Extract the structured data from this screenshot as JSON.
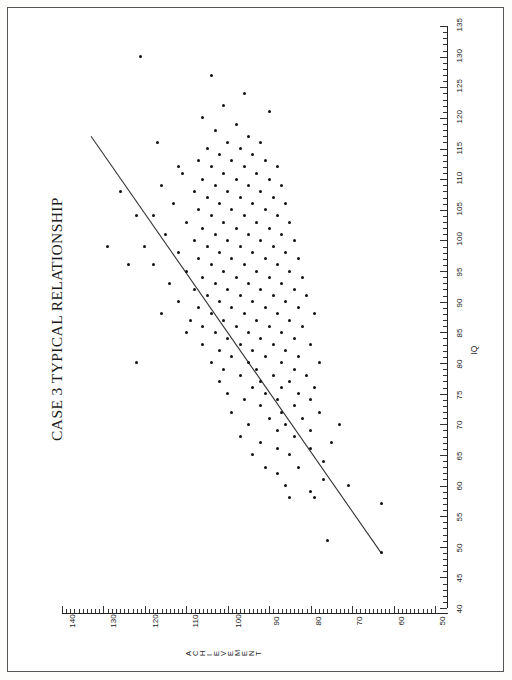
{
  "page": {
    "orientation": "rotated-90",
    "frame_color": "#555555",
    "background": "#ffffff"
  },
  "chart_data": {
    "type": "scatter",
    "title": "CASE 3 TYPICAL RELATIONSHIP",
    "xlabel": "IQ",
    "ylabel": "ACHIEVEMENT",
    "xlim": [
      40,
      135
    ],
    "ylim": [
      50,
      140
    ],
    "grid": false,
    "legend": null,
    "xticks": [
      40,
      45,
      50,
      55,
      60,
      65,
      70,
      75,
      80,
      85,
      90,
      95,
      100,
      105,
      110,
      115,
      120,
      125,
      130,
      135
    ],
    "yticks": [
      50,
      60,
      70,
      80,
      90,
      100,
      110,
      120,
      130,
      140
    ],
    "minor_tick_step": 1,
    "marker": "filled-circle",
    "marker_color": "#111111",
    "trendline": {
      "type": "linear-regression",
      "color": "#333333",
      "x_start": 49,
      "y_start": 63,
      "x_end": 117,
      "y_end": 133
    },
    "points": [
      [
        49,
        63
      ],
      [
        51,
        76
      ],
      [
        57,
        63
      ],
      [
        58,
        79
      ],
      [
        58,
        85
      ],
      [
        59,
        80
      ],
      [
        60,
        71
      ],
      [
        60,
        86
      ],
      [
        61,
        77
      ],
      [
        62,
        88
      ],
      [
        63,
        83
      ],
      [
        63,
        91
      ],
      [
        64,
        77
      ],
      [
        65,
        85
      ],
      [
        65,
        94
      ],
      [
        66,
        80
      ],
      [
        66,
        88
      ],
      [
        67,
        75
      ],
      [
        67,
        92
      ],
      [
        68,
        84
      ],
      [
        68,
        97
      ],
      [
        69,
        80
      ],
      [
        69,
        88
      ],
      [
        70,
        73
      ],
      [
        70,
        86
      ],
      [
        70,
        95
      ],
      [
        71,
        82
      ],
      [
        71,
        90
      ],
      [
        72,
        78
      ],
      [
        72,
        87
      ],
      [
        72,
        99
      ],
      [
        73,
        84
      ],
      [
        73,
        92
      ],
      [
        74,
        80
      ],
      [
        74,
        88
      ],
      [
        74,
        96
      ],
      [
        75,
        83
      ],
      [
        75,
        91
      ],
      [
        75,
        100
      ],
      [
        76,
        79
      ],
      [
        76,
        87
      ],
      [
        76,
        94
      ],
      [
        77,
        85
      ],
      [
        77,
        92
      ],
      [
        77,
        102
      ],
      [
        78,
        81
      ],
      [
        78,
        89
      ],
      [
        78,
        97
      ],
      [
        79,
        84
      ],
      [
        79,
        93
      ],
      [
        79,
        101
      ],
      [
        80,
        78
      ],
      [
        80,
        87
      ],
      [
        80,
        95
      ],
      [
        80,
        104
      ],
      [
        81,
        83
      ],
      [
        81,
        91
      ],
      [
        81,
        99
      ],
      [
        82,
        86
      ],
      [
        82,
        94
      ],
      [
        82,
        102
      ],
      [
        83,
        80
      ],
      [
        83,
        89
      ],
      [
        83,
        97
      ],
      [
        83,
        106
      ],
      [
        84,
        84
      ],
      [
        84,
        92
      ],
      [
        84,
        100
      ],
      [
        85,
        87
      ],
      [
        85,
        95
      ],
      [
        85,
        103
      ],
      [
        85,
        110
      ],
      [
        86,
        82
      ],
      [
        86,
        90
      ],
      [
        86,
        98
      ],
      [
        86,
        106
      ],
      [
        87,
        85
      ],
      [
        87,
        93
      ],
      [
        87,
        101
      ],
      [
        87,
        109
      ],
      [
        88,
        79
      ],
      [
        88,
        88
      ],
      [
        88,
        96
      ],
      [
        88,
        104
      ],
      [
        89,
        83
      ],
      [
        89,
        91
      ],
      [
        89,
        99
      ],
      [
        89,
        107
      ],
      [
        90,
        86
      ],
      [
        90,
        94
      ],
      [
        90,
        102
      ],
      [
        90,
        112
      ],
      [
        91,
        81
      ],
      [
        91,
        89
      ],
      [
        91,
        97
      ],
      [
        91,
        105
      ],
      [
        92,
        84
      ],
      [
        92,
        92
      ],
      [
        92,
        100
      ],
      [
        92,
        108
      ],
      [
        93,
        87
      ],
      [
        93,
        95
      ],
      [
        93,
        103
      ],
      [
        93,
        114
      ],
      [
        94,
        82
      ],
      [
        94,
        90
      ],
      [
        94,
        98
      ],
      [
        94,
        106
      ],
      [
        95,
        85
      ],
      [
        95,
        93
      ],
      [
        95,
        101
      ],
      [
        95,
        110
      ],
      [
        96,
        88
      ],
      [
        96,
        96
      ],
      [
        96,
        104
      ],
      [
        96,
        118
      ],
      [
        97,
        83
      ],
      [
        97,
        91
      ],
      [
        97,
        99
      ],
      [
        97,
        107
      ],
      [
        98,
        86
      ],
      [
        98,
        94
      ],
      [
        98,
        102
      ],
      [
        98,
        112
      ],
      [
        99,
        89
      ],
      [
        99,
        97
      ],
      [
        99,
        105
      ],
      [
        99,
        120
      ],
      [
        100,
        84
      ],
      [
        100,
        92
      ],
      [
        100,
        100
      ],
      [
        100,
        108
      ],
      [
        101,
        87
      ],
      [
        101,
        95
      ],
      [
        101,
        103
      ],
      [
        101,
        115
      ],
      [
        102,
        90
      ],
      [
        102,
        98
      ],
      [
        102,
        106
      ],
      [
        103,
        85
      ],
      [
        103,
        93
      ],
      [
        103,
        101
      ],
      [
        103,
        110
      ],
      [
        104,
        88
      ],
      [
        104,
        96
      ],
      [
        104,
        104
      ],
      [
        104,
        122
      ],
      [
        105,
        91
      ],
      [
        105,
        99
      ],
      [
        105,
        107
      ],
      [
        106,
        86
      ],
      [
        106,
        94
      ],
      [
        106,
        102
      ],
      [
        106,
        113
      ],
      [
        107,
        89
      ],
      [
        107,
        97
      ],
      [
        107,
        105
      ],
      [
        108,
        92
      ],
      [
        108,
        100
      ],
      [
        108,
        108
      ],
      [
        109,
        87
      ],
      [
        109,
        95
      ],
      [
        109,
        103
      ],
      [
        109,
        116
      ],
      [
        110,
        90
      ],
      [
        110,
        98
      ],
      [
        110,
        106
      ],
      [
        111,
        93
      ],
      [
        111,
        101
      ],
      [
        111,
        111
      ],
      [
        112,
        88
      ],
      [
        112,
        96
      ],
      [
        112,
        104
      ],
      [
        113,
        91
      ],
      [
        113,
        99
      ],
      [
        113,
        107
      ],
      [
        114,
        94
      ],
      [
        114,
        102
      ],
      [
        115,
        97
      ],
      [
        115,
        105
      ],
      [
        116,
        92
      ],
      [
        116,
        100
      ],
      [
        117,
        95
      ],
      [
        118,
        103
      ],
      [
        119,
        98
      ],
      [
        120,
        106
      ],
      [
        121,
        90
      ],
      [
        122,
        101
      ],
      [
        124,
        96
      ],
      [
        127,
        104
      ],
      [
        130,
        121
      ],
      [
        116,
        117
      ],
      [
        108,
        126
      ],
      [
        99,
        129
      ],
      [
        112,
        112
      ],
      [
        104,
        118
      ],
      [
        96,
        124
      ],
      [
        88,
        116
      ],
      [
        80,
        122
      ]
    ]
  }
}
